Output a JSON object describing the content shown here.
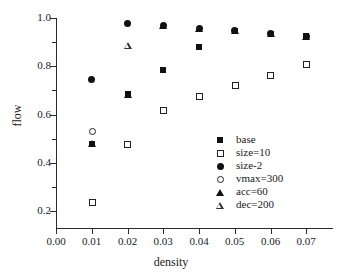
{
  "chart_data": {
    "type": "scatter",
    "title": "",
    "xlabel": "density",
    "ylabel": "flow",
    "xlim": [
      0.0,
      0.0775
    ],
    "ylim": [
      0.13,
      1.0
    ],
    "grid": false,
    "legend_position": "right-lower",
    "xticks": [
      "0.00",
      "0.01",
      "0.02",
      "0.03",
      "0.04",
      "0.05",
      "0.06",
      "0.07"
    ],
    "xtick_values": [
      0.0,
      0.01,
      0.02,
      0.03,
      0.04,
      0.05,
      0.06,
      0.07
    ],
    "yticks": [
      "0.2",
      "0.4",
      "0.6",
      "0.8",
      "1.0"
    ],
    "ytick_values": [
      0.2,
      0.4,
      0.6,
      0.8,
      1.0
    ],
    "yminor_values": [
      0.3,
      0.5,
      0.7,
      0.9
    ],
    "x": [
      0.01,
      0.02,
      0.03,
      0.04,
      0.05,
      0.06,
      0.07
    ],
    "series": [
      {
        "name": "base",
        "marker": "filled-square",
        "x": [
          0.01,
          0.02,
          0.03,
          0.04,
          0.05,
          0.06,
          0.07
        ],
        "values": [
          0.48,
          0.685,
          0.783,
          0.878,
          0.948,
          0.935,
          0.925
        ]
      },
      {
        "name": "size=10",
        "marker": "open-square",
        "x": [
          0.01,
          0.02,
          0.03,
          0.04,
          0.05,
          0.06,
          0.07
        ],
        "values": [
          0.238,
          0.478,
          0.618,
          0.678,
          0.723,
          0.765,
          0.807
        ]
      },
      {
        "name": "size-2",
        "marker": "filled-circle",
        "x": [
          0.01,
          0.02,
          0.03,
          0.04,
          0.05,
          0.06,
          0.07
        ],
        "values": [
          0.745,
          0.978,
          0.97,
          0.958,
          0.948,
          0.935,
          0.925
        ]
      },
      {
        "name": "vmax=300",
        "marker": "open-circle",
        "x": [
          0.01
        ],
        "values": [
          0.53
        ]
      },
      {
        "name": "acc=60",
        "marker": "filled-triangle",
        "x": [
          0.01,
          0.02,
          0.03,
          0.04,
          0.05,
          0.06,
          0.07
        ],
        "values": [
          0.48,
          0.685,
          0.97,
          0.958,
          0.948,
          0.935,
          0.925
        ]
      },
      {
        "name": "dec=200",
        "marker": "open-triangle",
        "x": [
          0.02
        ],
        "values": [
          0.885
        ]
      }
    ]
  },
  "axes": {
    "x_title": "density",
    "y_title": "flow"
  },
  "legend": {
    "entries": [
      {
        "label": "base",
        "marker": "filled-square"
      },
      {
        "label": "size=10",
        "marker": "open-square"
      },
      {
        "label": "size-2",
        "marker": "filled-circle"
      },
      {
        "label": "vmax=300",
        "marker": "open-circle"
      },
      {
        "label": "acc=60",
        "marker": "filled-triangle"
      },
      {
        "label": "dec=200",
        "marker": "open-triangle"
      }
    ]
  },
  "colors": {
    "marker": "#111111",
    "axis": "#2b2b2b",
    "background": "#ffffff"
  }
}
